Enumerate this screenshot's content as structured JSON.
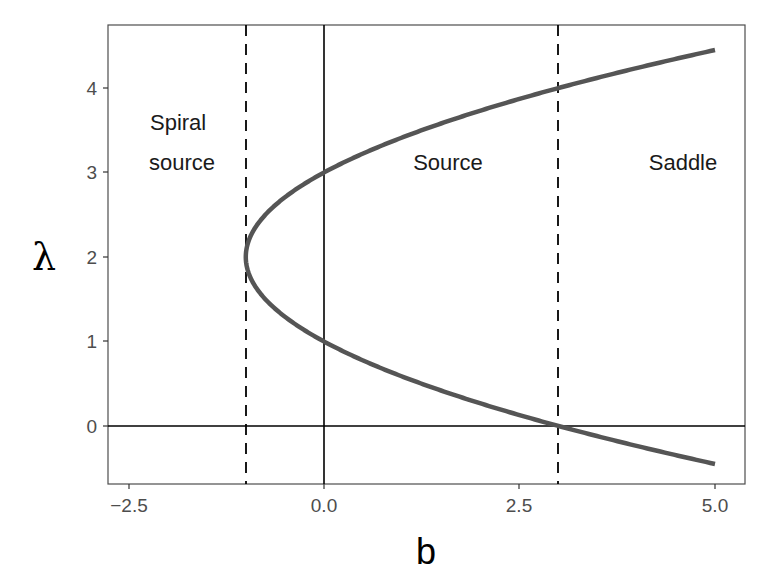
{
  "chart_data": {
    "type": "line",
    "title": "",
    "xlabel": "b",
    "ylabel": "λ",
    "xlim": [
      -2.8,
      5.3
    ],
    "ylim": [
      -0.68,
      4.7
    ],
    "x_ticks": [
      -2.5,
      0.0,
      2.5,
      5.0
    ],
    "x_tick_labels": [
      "-2.5",
      "0.0",
      "2.5",
      "5.0"
    ],
    "y_ticks": [
      0,
      1,
      2,
      3,
      4
    ],
    "y_tick_labels": [
      "0",
      "1",
      "2",
      "3",
      "4"
    ],
    "grid": false,
    "series": [
      {
        "name": "λ upper = 2 + sqrt(1 + b)",
        "color": "#555555",
        "x": [
          -1.0,
          -0.75,
          -0.5,
          0.0,
          0.5,
          1.0,
          1.5,
          2.0,
          2.5,
          3.0,
          3.5,
          4.0,
          4.5,
          5.0
        ],
        "y": [
          2.0,
          2.5,
          2.707,
          3.0,
          3.225,
          3.414,
          3.581,
          3.732,
          3.871,
          4.0,
          4.121,
          4.236,
          4.345,
          4.449
        ]
      },
      {
        "name": "λ lower = 2 - sqrt(1 + b)",
        "color": "#555555",
        "x": [
          -1.0,
          -0.75,
          -0.5,
          0.0,
          0.5,
          1.0,
          1.5,
          2.0,
          2.5,
          3.0,
          3.5,
          4.0,
          4.5,
          5.0
        ],
        "y": [
          2.0,
          1.5,
          1.293,
          1.0,
          0.775,
          0.586,
          0.419,
          0.268,
          0.129,
          0.0,
          -0.121,
          -0.236,
          -0.345,
          -0.449
        ]
      }
    ],
    "reference_lines": [
      {
        "orientation": "vertical",
        "x": 0,
        "style": "solid"
      },
      {
        "orientation": "horizontal",
        "y": 0,
        "style": "solid"
      },
      {
        "orientation": "vertical",
        "x": -1,
        "style": "dashed"
      },
      {
        "orientation": "vertical",
        "x": 3,
        "style": "dashed"
      }
    ],
    "annotations": [
      {
        "text": "Spiral\nsource",
        "x": -1.9,
        "y": 3.4
      },
      {
        "text": "Source",
        "x": 1.6,
        "y": 3.1
      },
      {
        "text": "Saddle",
        "x": 4.55,
        "y": 3.1
      }
    ],
    "legend": null
  },
  "labels": {
    "x_axis_title": "b",
    "y_axis_title": "λ",
    "x_ticks": [
      "−2.5",
      "0.0",
      "2.5",
      "5.0"
    ],
    "y_ticks": [
      "0",
      "1",
      "2",
      "3",
      "4"
    ],
    "region_spiral_line1": "Spiral",
    "region_spiral_line2": "source",
    "region_source": "Source",
    "region_saddle": "Saddle"
  }
}
